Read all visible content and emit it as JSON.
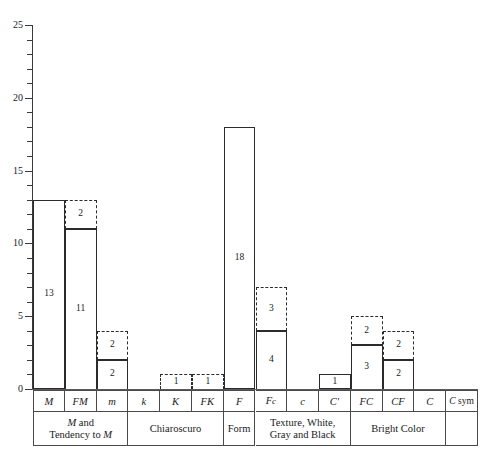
{
  "chart_data": {
    "type": "bar",
    "title": "",
    "xlabel": "",
    "ylabel": "",
    "ylim": [
      0,
      25
    ],
    "yticks": [
      0,
      5,
      10,
      15,
      20,
      25
    ],
    "ytick_labels": [
      "0",
      "5",
      "10",
      "15",
      "20",
      "25"
    ],
    "minor_tick_step": 1,
    "grid": false,
    "legend": "none",
    "categories": [
      "M",
      "FM",
      "m",
      "k",
      "K",
      "FK",
      "F",
      "Fc",
      "c",
      "C'",
      "FC",
      "CF",
      "C",
      "C sym"
    ],
    "series": [
      {
        "name": "solid",
        "style": "solid",
        "values": [
          13,
          11,
          2,
          0,
          0,
          0,
          18,
          4,
          0,
          1,
          3,
          2,
          0,
          0
        ]
      },
      {
        "name": "dashed",
        "style": "dashed",
        "values": [
          0,
          2,
          2,
          0,
          1,
          1,
          0,
          3,
          0,
          0,
          2,
          2,
          0,
          0
        ]
      }
    ],
    "totals": [
      13,
      13,
      4,
      0,
      1,
      1,
      18,
      7,
      0,
      1,
      5,
      4,
      0,
      0
    ],
    "bar_labels": [
      {
        "category": "M",
        "solid": "13",
        "dashed": ""
      },
      {
        "category": "FM",
        "solid": "11",
        "dashed": "2"
      },
      {
        "category": "m",
        "solid": "2",
        "dashed": "2"
      },
      {
        "category": "k",
        "solid": "",
        "dashed": ""
      },
      {
        "category": "K",
        "solid": "",
        "dashed": "1"
      },
      {
        "category": "FK",
        "solid": "",
        "dashed": "1"
      },
      {
        "category": "F",
        "solid": "18",
        "dashed": ""
      },
      {
        "category": "Fc",
        "solid": "4",
        "dashed": "3"
      },
      {
        "category": "c",
        "solid": "",
        "dashed": ""
      },
      {
        "category": "C'",
        "solid": "1",
        "dashed": ""
      },
      {
        "category": "FC",
        "solid": "3",
        "dashed": "2"
      },
      {
        "category": "CF",
        "solid": "2",
        "dashed": "2"
      },
      {
        "category": "C",
        "solid": "",
        "dashed": ""
      },
      {
        "category": "C sym",
        "solid": "",
        "dashed": ""
      }
    ],
    "groups": [
      {
        "label": "M and Tendency to M",
        "label_html": "<i>M</i> and<br>Tendency to <i>M</i>",
        "span": 3
      },
      {
        "label": "Chiaroscuro",
        "label_html": "Chiaroscuro",
        "span": 3
      },
      {
        "label": "Form",
        "label_html": "Form",
        "span": 1
      },
      {
        "label": "Texture, White, Gray and Black",
        "label_html": "Texture, White,<br>Gray and Black",
        "span": 3
      },
      {
        "label": "Bright Color",
        "label_html": "Bright Color",
        "span": 3
      },
      {
        "label": "",
        "label_html": "",
        "span": 1
      }
    ],
    "colors": {
      "axis": "#3a3a3a",
      "bar_outline": "#2b2b2b",
      "baseline": "#5a5a5a",
      "table_border": "#4a4a4a",
      "text": "#1a1a1a",
      "background": "#ffffff"
    }
  }
}
